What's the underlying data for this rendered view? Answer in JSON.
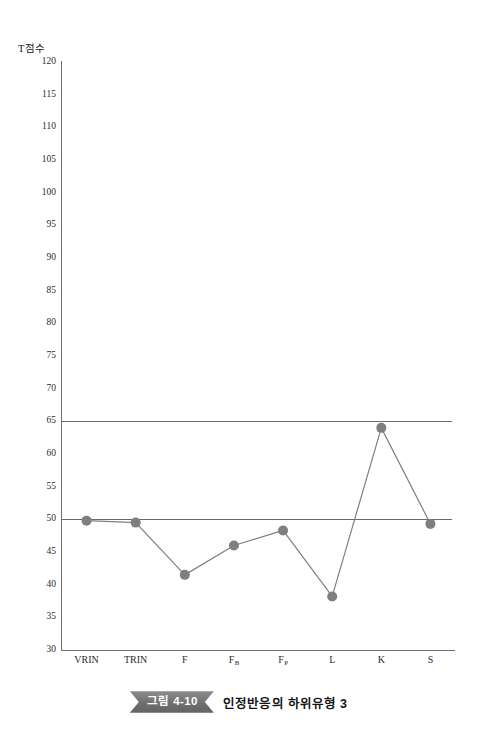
{
  "chart_data": {
    "type": "line",
    "title": "",
    "xlabel": "",
    "ylabel": "T점수",
    "ylim": [
      30,
      120
    ],
    "yticks": [
      120,
      115,
      110,
      105,
      100,
      95,
      90,
      85,
      80,
      75,
      70,
      65,
      60,
      55,
      50,
      45,
      40,
      35,
      30
    ],
    "grid": false,
    "legend": "none",
    "categories": [
      "VRIN",
      "TRIN",
      "F",
      "FB",
      "FP",
      "L",
      "K",
      "S"
    ],
    "category_labels": [
      {
        "base": "VRIN",
        "sub": ""
      },
      {
        "base": "TRIN",
        "sub": ""
      },
      {
        "base": "F",
        "sub": ""
      },
      {
        "base": "F",
        "sub": "B"
      },
      {
        "base": "F",
        "sub": "P"
      },
      {
        "base": "L",
        "sub": ""
      },
      {
        "base": "K",
        "sub": ""
      },
      {
        "base": "S",
        "sub": ""
      }
    ],
    "series": [
      {
        "name": "T점수",
        "values": [
          49.8,
          49.5,
          41.5,
          46.0,
          48.3,
          38.2,
          64.0,
          49.3
        ],
        "marker": "circle",
        "marker_color": "#7f7f7f",
        "line_color": "#7f7f7f"
      }
    ],
    "reference_lines": [
      {
        "value": 65,
        "color": "#6a6a6a"
      },
      {
        "value": 50,
        "color": "#6a6a6a"
      }
    ]
  },
  "caption": {
    "figure_number": "그림 4-10",
    "title": "인정반응의 하위유형 3"
  },
  "colors": {
    "axis": "#6e6e6e",
    "series": "#7f7f7f",
    "reference": "#6a6a6a",
    "ribbon": "#6f6f6f",
    "text": "#1a1a1a"
  }
}
